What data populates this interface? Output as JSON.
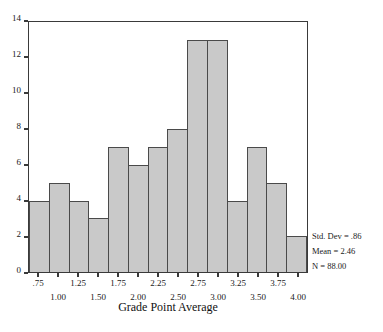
{
  "chart_data": {
    "type": "bar",
    "title": "",
    "xlabel": "Grade Point Average",
    "ylabel": "",
    "ylim": [
      0,
      14
    ],
    "xlim": [
      0.625,
      4.125
    ],
    "grid": false,
    "bin_width": 0.25,
    "categories": [
      "0.75",
      "1.00",
      "1.25",
      "1.50",
      "1.75",
      "2.00",
      "2.25",
      "2.50",
      "2.75",
      "3.00",
      "3.25",
      "3.50",
      "3.75",
      "4.00"
    ],
    "values": [
      4,
      5,
      4,
      3,
      7,
      6,
      7,
      8,
      13,
      13,
      4,
      7,
      5,
      2
    ],
    "y_ticks": [
      "0",
      "2",
      "4",
      "6",
      "8",
      "10",
      "12",
      "14"
    ],
    "y_tick_values": [
      0,
      2,
      4,
      6,
      8,
      10,
      12,
      14
    ],
    "x_ticks_upper": [
      "0.75",
      "1.25",
      "1.75",
      "2.25",
      "2.75",
      "3.25",
      "3.75"
    ],
    "x_ticks_lower": [
      "1.00",
      "1.50",
      "2.00",
      "2.50",
      "3.00",
      "3.50",
      "4.00"
    ],
    "x_tick_labels_upper": [
      ".75",
      "1.25",
      "1.75",
      "2.25",
      "2.75",
      "3.25",
      "3.75"
    ],
    "x_tick_labels_lower": [
      "1.00",
      "1.50",
      "2.00",
      "2.50",
      "3.00",
      "3.50",
      "4.00"
    ],
    "annotations": [
      "Std. Dev = .86",
      "Mean = 2.46",
      "N = 88.00"
    ],
    "bar_fill_color": "#c9c9c9",
    "bar_edge_color": "#4a4a4a",
    "frame_color": "#3a3a3a"
  },
  "stats": {
    "std_dev": "Std. Dev = .86",
    "mean": "Mean = 2.46",
    "n": "N = 88.00"
  },
  "axis": {
    "x_title": "Grade Point Average"
  },
  "bottom_caption": ""
}
